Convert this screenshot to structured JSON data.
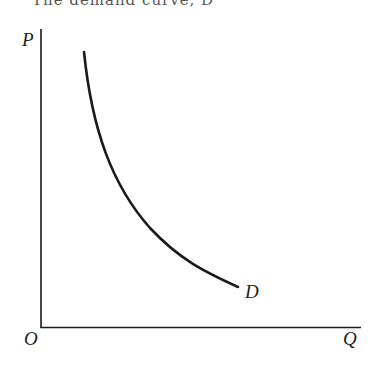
{
  "caption": "The demand curve, D",
  "axes": {
    "y_label": "P",
    "x_label": "Q",
    "origin_label": "O"
  },
  "curve": {
    "label": "D",
    "description": "downward-sloping convex demand curve"
  },
  "colors": {
    "line": "#1a1a1a",
    "text": "#222222"
  }
}
